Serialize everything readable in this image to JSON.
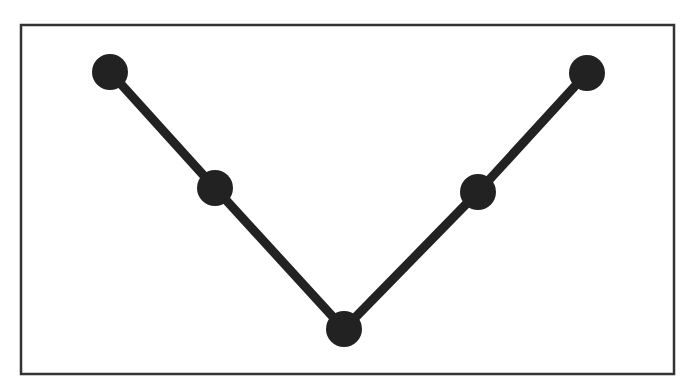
{
  "chart_data": {
    "type": "line",
    "title": "",
    "xlabel": "",
    "ylabel": "",
    "grid": false,
    "legend": null,
    "x": [
      1,
      2,
      3,
      4,
      5
    ],
    "series": [
      {
        "name": "series-1",
        "values": [
          5,
          3,
          0,
          3,
          5
        ]
      }
    ],
    "style": {
      "line_color": "#222222",
      "marker_color": "#222222",
      "marker": "circle",
      "frame_color": "#333333"
    }
  },
  "points_px": [
    {
      "x": 110,
      "y": 72
    },
    {
      "x": 215,
      "y": 188
    },
    {
      "x": 344,
      "y": 329
    },
    {
      "x": 478,
      "y": 192
    },
    {
      "x": 587,
      "y": 73
    }
  ]
}
